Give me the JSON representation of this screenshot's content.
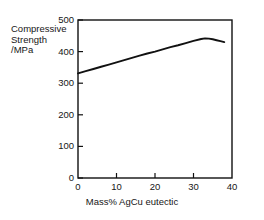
{
  "chart_data": {
    "type": "line",
    "title": "",
    "subtitle": "",
    "xlabel": "Mass% AgCu eutectic",
    "ylabel": "Compressive Strength /MPa",
    "ylabel_lines": [
      "Compressive",
      "Strength",
      "/MPa"
    ],
    "xlim": [
      0,
      40
    ],
    "ylim": [
      0,
      500
    ],
    "xticks": [
      0,
      10,
      20,
      30,
      40
    ],
    "yticks": [
      0,
      100,
      200,
      300,
      400,
      500
    ],
    "xtick_labels": [
      "0",
      "10",
      "20",
      "30",
      "40"
    ],
    "ytick_labels": [
      "0",
      "100",
      "200",
      "300",
      "400",
      "500"
    ],
    "grid": false,
    "legend": false,
    "legend_position": "none",
    "tick_direction": "in",
    "line_color": "#111111",
    "axis_color": "#111111",
    "background_color": "#ffffff",
    "series": [
      {
        "name": "Compressive Strength",
        "x": [
          0,
          2,
          4,
          6,
          8,
          10,
          12,
          14,
          16,
          18,
          20,
          22,
          24,
          26,
          28,
          30,
          32,
          33,
          34,
          35,
          36,
          37,
          38
        ],
        "values": [
          331,
          338,
          345,
          352,
          359,
          366,
          373,
          380,
          387,
          394,
          400,
          407,
          414,
          420,
          427,
          434,
          440,
          442,
          441,
          439,
          436,
          433,
          430
        ]
      }
    ],
    "annotations": []
  }
}
